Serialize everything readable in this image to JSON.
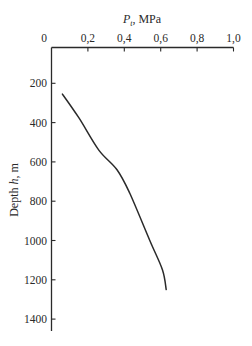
{
  "chart_data": {
    "type": "line",
    "title": "",
    "xlabel": "P_t, MPa",
    "xlabel_parts": {
      "symbol": "P",
      "subscript": "t",
      "unit": ", MPa"
    },
    "ylabel": "Depth h, m",
    "ylabel_parts": {
      "prefix": "Depth ",
      "symbol": "h",
      "unit": ", m"
    },
    "x_axis_position": "top",
    "y_axis_inverted": true,
    "xlim": [
      0,
      1.0
    ],
    "ylim": [
      0,
      1400
    ],
    "x_ticks": [
      "0",
      "0,2",
      "0,4",
      "0,6",
      "0,8",
      "1,0"
    ],
    "x_tick_values": [
      0,
      0.2,
      0.4,
      0.6,
      0.8,
      1.0
    ],
    "y_ticks": [
      "200",
      "400",
      "600",
      "800",
      "1000",
      "1200",
      "1400"
    ],
    "y_tick_values": [
      200,
      400,
      600,
      800,
      1000,
      1200,
      1400
    ],
    "grid": false,
    "legend": null,
    "series": [
      {
        "name": "P_t vs depth",
        "color": "#2a2a2a",
        "x": [
          0.06,
          0.15,
          0.26,
          0.36,
          0.43,
          0.54,
          0.61,
          0.63
        ],
        "y": [
          255,
          375,
          540,
          640,
          760,
          1000,
          1150,
          1250
        ]
      }
    ]
  }
}
